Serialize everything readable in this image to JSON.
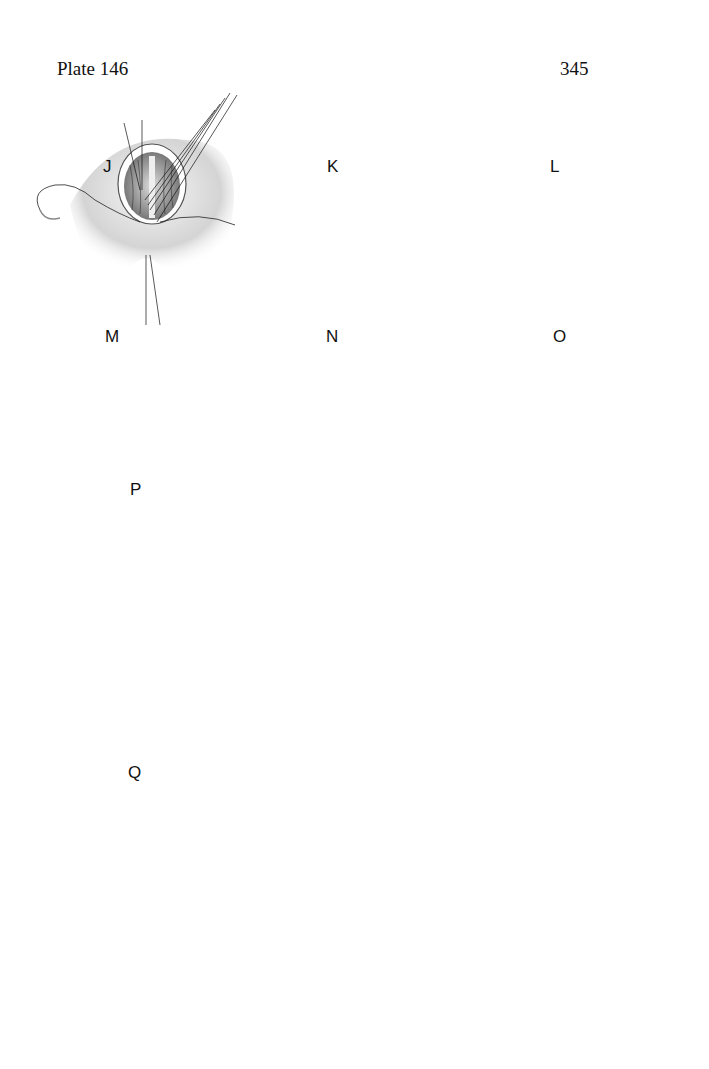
{
  "page": {
    "plate_label": "Plate 146",
    "page_number": "345"
  },
  "figures": [
    {
      "id": "J",
      "label": "J",
      "description": "opened bowel, posterior row of sutures with multiple needle threads"
    },
    {
      "id": "K",
      "label": "K",
      "description": "inner layer sutures completed, traction sutures at both ends"
    },
    {
      "id": "L",
      "label": "L",
      "description": "continuous suture of inner layer"
    },
    {
      "id": "M",
      "label": "M",
      "description": "beginning anterior seromuscular closure"
    },
    {
      "id": "N",
      "label": "N",
      "description": "anterior closure continued with interrupted sutures"
    },
    {
      "id": "O",
      "label": "O",
      "description": "completed row of interrupted sutures with long ends"
    },
    {
      "id": "P",
      "label": "P",
      "description": "stomach and bowel loops with completed anastomosis and clamped segment, dashed incision line"
    },
    {
      "id": "Q",
      "label": "Q",
      "description": "posterior row of sutures placed between bowel loops with clamps at both ends"
    }
  ],
  "colors": {
    "ink": "#111111",
    "tissue_light": "#e9e9e9",
    "tissue_mid": "#c8c8c8",
    "tissue_dark": "#8a8a8a"
  }
}
